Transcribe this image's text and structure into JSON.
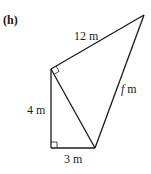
{
  "diagram": {
    "part_label": "(h)",
    "sides": {
      "hypotenuse_top": "12 m",
      "left_vertical": "4 m",
      "bottom": "3 m",
      "unknown_var": "f",
      "unknown_unit": " m"
    },
    "right_angles": [
      "bottom-left vertex",
      "top-left vertex (between 12 m side and inner diagonal)"
    ],
    "colors": {
      "line": "#1a1a1a",
      "background": "#ffffff"
    }
  }
}
